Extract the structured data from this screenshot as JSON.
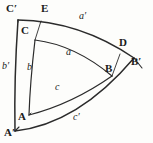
{
  "figure": {
    "stroke_color": "#2b2b2b",
    "background_color": "#fdfdfb",
    "vertices": [
      {
        "id": "C-prime",
        "label": "C′",
        "x": 14,
        "y": 12
      },
      {
        "id": "E",
        "label": "E",
        "x": 45,
        "y": 12
      },
      {
        "id": "C",
        "label": "C",
        "x": 27,
        "y": 33
      },
      {
        "id": "D",
        "label": "D",
        "x": 123,
        "y": 45
      },
      {
        "id": "B-prime",
        "label": "B′",
        "x": 137,
        "y": 64
      },
      {
        "id": "B",
        "label": "B",
        "x": 110,
        "y": 70
      },
      {
        "id": "A",
        "label": "A",
        "x": 22,
        "y": 118
      },
      {
        "id": "A-prime",
        "label": "A′",
        "x": 10,
        "y": 134
      }
    ],
    "sides": [
      {
        "id": "a-prime",
        "label": "a′",
        "x": 82,
        "y": 17
      },
      {
        "id": "a",
        "label": "a",
        "x": 69,
        "y": 53
      },
      {
        "id": "b-prime",
        "label": "b′",
        "x": 5,
        "y": 67
      },
      {
        "id": "b",
        "label": "b",
        "x": 30,
        "y": 68
      },
      {
        "id": "c",
        "label": "c",
        "x": 58,
        "y": 88
      },
      {
        "id": "c-prime",
        "label": "c′",
        "x": 76,
        "y": 118
      }
    ]
  }
}
